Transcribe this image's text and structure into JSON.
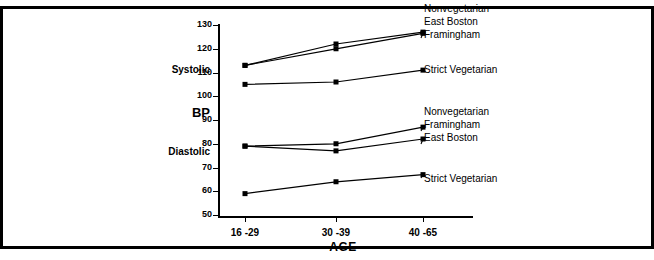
{
  "figure": {
    "has_top_rule": true,
    "has_bottom_rule": true,
    "background": "#ffffff",
    "ink": "#000000"
  },
  "labels": {
    "systolic": "Systolic",
    "bp": "BP",
    "diastolic": "Diastolic",
    "axis_title": "AGE"
  },
  "legend_systolic": [
    {
      "name": "Nonvegetarian",
      "label": "Nonvegetarian"
    },
    {
      "name": "East Boston",
      "label": "East Boston"
    },
    {
      "name": "Framingham",
      "label": "Framingham"
    },
    {
      "name": "Strict Vegetarian",
      "label": "Strict Vegetarian"
    }
  ],
  "legend_diastolic": [
    {
      "name": "Nonvegetarian",
      "label": "Nonvegetarian"
    },
    {
      "name": "Framingham",
      "label": "Framingham"
    },
    {
      "name": "East Boston",
      "label": "East Boston"
    },
    {
      "name": "Strict Vegetarian",
      "label": "Strict Vegetarian"
    }
  ],
  "chart_data": {
    "type": "line",
    "title": "",
    "xlabel": "AGE",
    "ylabel": "BP",
    "categories": [
      "16 -29",
      "30 -39",
      "40 -65"
    ],
    "ylim": [
      50,
      130
    ],
    "yticks": [
      50,
      60,
      70,
      80,
      90,
      100,
      110,
      120,
      130
    ],
    "ytick_labels": [
      "50",
      "60",
      "70",
      "80",
      "90",
      "100",
      "110",
      "120",
      "130"
    ],
    "grid": false,
    "legend_position": "right",
    "marker": "square",
    "groups": [
      {
        "group": "Systolic",
        "series": [
          {
            "name": "East Boston",
            "values": [
              113,
              122,
              127
            ]
          },
          {
            "name": "Framingham",
            "values": [
              113,
              120,
              126.5
            ]
          },
          {
            "name": "Strict Vegetarian",
            "values": [
              105,
              106,
              111
            ]
          }
        ]
      },
      {
        "group": "Diastolic",
        "series": [
          {
            "name": "Framingham",
            "values": [
              79,
              80,
              87
            ]
          },
          {
            "name": "East Boston",
            "values": [
              79,
              77,
              82
            ]
          },
          {
            "name": "Strict Vegetarian",
            "values": [
              59,
              64,
              67
            ]
          }
        ]
      }
    ],
    "annotations": [
      "Systolic group labelled: Nonvegetarian (East Boston, Framingham) and Strict Vegetarian",
      "Diastolic group labelled: Nonvegetarian (Framingham, East Boston) and Strict Vegetarian"
    ]
  }
}
